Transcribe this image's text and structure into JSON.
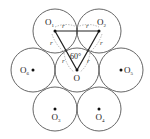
{
  "diagram": {
    "type": "hexagonal-circle-packing",
    "radius_label": "r",
    "angle_label": "60°",
    "circles": [
      {
        "id": "O",
        "label": "O",
        "sub": "",
        "cx": 77,
        "cy": 70
      },
      {
        "id": "O1",
        "label": "O",
        "sub": "1",
        "cx": 55,
        "cy": 31
      },
      {
        "id": "O2",
        "label": "O",
        "sub": "2",
        "cx": 99,
        "cy": 31
      },
      {
        "id": "O3",
        "label": "O",
        "sub": "3",
        "cx": 55,
        "cy": 109
      },
      {
        "id": "O4",
        "label": "O",
        "sub": "4",
        "cx": 99,
        "cy": 109
      },
      {
        "id": "O5",
        "label": "O",
        "sub": "5",
        "cx": 121,
        "cy": 70
      },
      {
        "id": "O6",
        "label": "O",
        "sub": "6",
        "cx": 33,
        "cy": 70
      }
    ],
    "triangle": [
      "O1",
      "O2",
      "O"
    ],
    "colors": {
      "stroke": "#555555",
      "triangle": "#222222",
      "dash": "#888888"
    }
  }
}
